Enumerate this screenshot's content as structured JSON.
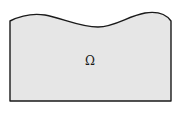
{
  "diagram": {
    "domain_label": "Ω",
    "fill_color": "#e6e6e6",
    "stroke_color": "#1a1a1a"
  }
}
